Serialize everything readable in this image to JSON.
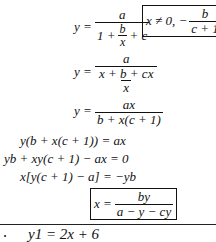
{
  "equations": [
    {
      "lhs": "y =",
      "num": "a",
      "den_prefix": "1 +",
      "den_frac_num": "b",
      "den_frac_den": "x",
      "den_suffix": "+ c"
    },
    {
      "condition_prefix": "x ≠ 0, −",
      "condition_num": "b",
      "condition_den": "c + 1"
    },
    {
      "lhs": "y =",
      "num": "a",
      "den": "x + b + cx",
      "outer_den": "x"
    },
    {
      "lhs": "y =",
      "num": "ax",
      "den": "b + x(c + 1)"
    },
    {
      "text": "y(b + x(c + 1)) = ax"
    },
    {
      "text": "yb + xy(c + 1) − ax = 0"
    },
    {
      "text": "x[y(c + 1) − a] = −yb"
    },
    {
      "lhs": "x =",
      "num": "by",
      "den": "a − y − cy"
    }
  ],
  "next_problem": {
    "bullet": ".",
    "text": "y1 = 2x + 6"
  }
}
